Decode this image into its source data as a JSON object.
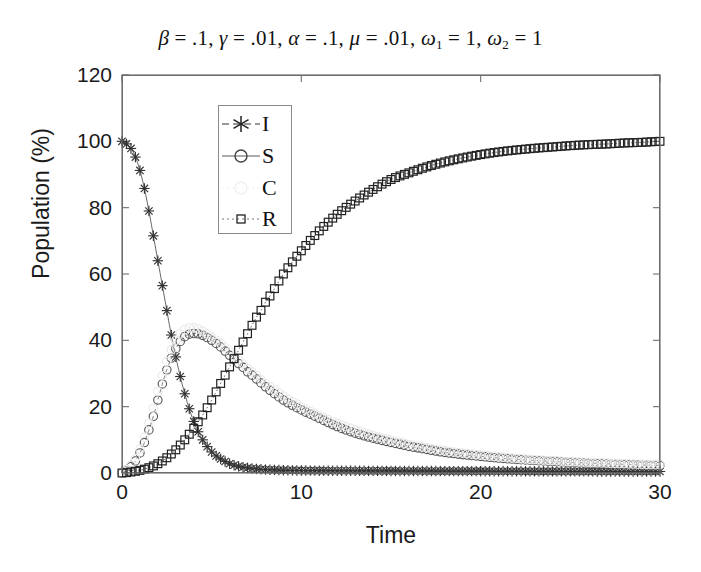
{
  "chart_data": {
    "type": "line",
    "title_parts": {
      "beta": "β",
      "beta_val": " = .1, ",
      "gamma": "γ",
      "gamma_val": " = .01, ",
      "alpha": "α",
      "alpha_val": " = .1, ",
      "mu": "μ",
      "mu_val": " = .01, ",
      "omega": "ω",
      "omega1_sub": "1",
      "omega1_val": " = 1, ",
      "omega2_sub": "2",
      "omega2_val": " = 1"
    },
    "xlabel": "Time",
    "ylabel": "Population (%)",
    "xlim": [
      0,
      30
    ],
    "ylim": [
      0,
      120
    ],
    "xticks": [
      0,
      10,
      20,
      30
    ],
    "yticks": [
      0,
      20,
      40,
      60,
      80,
      100,
      120
    ],
    "grid": false,
    "legend_position": "upper-left-inside",
    "legend": [
      "I",
      "S",
      "C",
      "R"
    ],
    "series": [
      {
        "name": "I",
        "marker": "asterisk",
        "color": "#333333",
        "linestyle": "solid",
        "x": [
          0,
          0.3,
          0.6,
          0.9,
          1.2,
          1.5,
          1.8,
          2.1,
          2.4,
          2.7,
          3,
          3.3,
          3.6,
          3.9,
          4.2,
          4.5,
          4.8,
          5.1,
          5.4,
          6,
          6.6,
          7.2,
          7.8,
          8.4,
          9,
          10,
          11,
          12,
          14,
          16,
          18,
          20,
          22,
          24,
          26,
          28,
          30
        ],
        "y": [
          100,
          99,
          97,
          93,
          87,
          79,
          70,
          61,
          52,
          43,
          35,
          28,
          22,
          17,
          13,
          10,
          7.6,
          5.8,
          4.5,
          2.8,
          1.9,
          1.4,
          1.1,
          0.95,
          0.85,
          0.75,
          0.7,
          0.68,
          0.65,
          0.6,
          0.58,
          0.55,
          0.52,
          0.5,
          0.48,
          0.46,
          0.45
        ]
      },
      {
        "name": "S",
        "marker": "circle",
        "color": "#5a5a5a",
        "linestyle": "dashed",
        "x": [
          0,
          0.3,
          0.6,
          0.9,
          1.2,
          1.5,
          1.8,
          2.1,
          2.4,
          2.7,
          3,
          3.3,
          3.6,
          3.9,
          4.2,
          4.5,
          5,
          5.5,
          6,
          6.5,
          7,
          8,
          9,
          10,
          11,
          12,
          13,
          14,
          15,
          16,
          18,
          20,
          22,
          24,
          26,
          28,
          30
        ],
        "y": [
          0,
          1,
          2.5,
          5,
          8.5,
          13,
          18,
          24,
          29.5,
          34,
          37.5,
          40,
          41.5,
          42,
          42,
          41.5,
          40,
          38,
          35.5,
          33,
          30.5,
          26,
          22,
          19,
          16.5,
          14,
          12,
          10.5,
          9.2,
          8,
          6.2,
          5,
          4.1,
          3.5,
          3,
          2.6,
          2.3
        ]
      },
      {
        "name": "C",
        "marker": "circle",
        "color": "#eaeaea",
        "linestyle": "dotted",
        "x": [
          0,
          0.3,
          0.6,
          0.9,
          1.2,
          1.5,
          1.8,
          2.1,
          2.4,
          2.7,
          3,
          3.3,
          3.6,
          3.9,
          4.2,
          4.5,
          5,
          5.5,
          6,
          6.5,
          7,
          8,
          9,
          10,
          11,
          12,
          13,
          14,
          15,
          16,
          18,
          20,
          22,
          24,
          26,
          28,
          30
        ],
        "y": [
          0,
          1.2,
          3,
          6,
          10,
          15,
          20.5,
          26.5,
          32,
          36.5,
          40,
          42.3,
          43.5,
          43.8,
          43.5,
          42.8,
          41,
          39,
          36.5,
          34,
          31.5,
          27,
          23.2,
          20,
          17.3,
          15,
          13,
          11.3,
          9.9,
          8.6,
          6.7,
          5.4,
          4.4,
          3.7,
          3.2,
          2.8,
          2.5
        ]
      },
      {
        "name": "R",
        "marker": "square",
        "color": "#222222",
        "linestyle": "dotted",
        "x": [
          0,
          0.5,
          1,
          1.5,
          2,
          2.5,
          3,
          3.5,
          4,
          4.5,
          5,
          5.5,
          6,
          6.5,
          7,
          7.5,
          8,
          9,
          10,
          11,
          12,
          13,
          14,
          15,
          16,
          17,
          18,
          19,
          20,
          21,
          22,
          23,
          24,
          25,
          26,
          27,
          28,
          29,
          30
        ],
        "y": [
          0,
          0.3,
          0.8,
          1.6,
          2.8,
          4.6,
          7,
          10,
          13.5,
          17.5,
          22,
          27,
          32,
          37,
          42,
          47,
          51.5,
          60,
          67,
          73,
          78,
          82,
          85.5,
          88.5,
          90.5,
          92.3,
          93.8,
          95,
          96,
          96.8,
          97.4,
          97.9,
          98.3,
          98.7,
          99,
          99.2,
          99.5,
          99.7,
          100
        ]
      }
    ]
  }
}
